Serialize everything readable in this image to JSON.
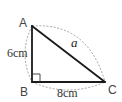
{
  "figure": {
    "type": "right-triangle",
    "vertices": {
      "A": {
        "label": "A"
      },
      "B": {
        "label": "B"
      },
      "C": {
        "label": "C"
      }
    },
    "sides": {
      "AB": {
        "label": "6cm",
        "length": 6,
        "unit": "cm"
      },
      "BC": {
        "label": "8cm",
        "length": 8,
        "unit": "cm"
      },
      "AC": {
        "label": "a",
        "length": null,
        "unit": "cm"
      }
    },
    "right_angle_at": "B",
    "colors": {
      "side": "#1a1a1a",
      "arc": "#9a9a9a",
      "label": "#444444"
    }
  }
}
